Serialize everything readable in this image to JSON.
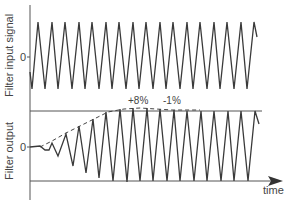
{
  "diagram": {
    "title": "",
    "colors": {
      "line": "#3a3a3a",
      "reference": "#555555",
      "text": "#444444",
      "background": "#ffffff"
    },
    "input_panel": {
      "ylabel": "Filter input signal",
      "zero_label": "0",
      "description": "Constant-amplitude sinusoid, ~17 cycles"
    },
    "output_panel": {
      "ylabel": "Filter output",
      "zero_label": "0",
      "description": "Oscillation amplitude grows under a dashed envelope, then settles between upper and lower reference lines",
      "annotations": [
        {
          "text": "+8%",
          "meaning": "overshoot"
        },
        {
          "text": "-1%",
          "meaning": "undershoot"
        }
      ]
    },
    "x_axis": {
      "label": "time",
      "arrow": true
    }
  }
}
